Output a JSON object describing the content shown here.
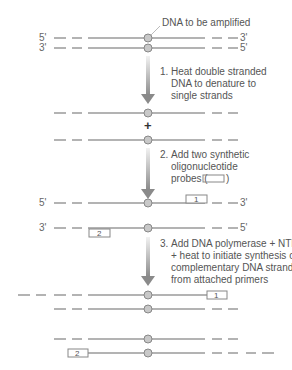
{
  "title_label": "DNA to be amplified",
  "ends": {
    "five": "5'",
    "three": "3'"
  },
  "plus": "+",
  "steps": [
    {
      "number": "1.",
      "lines": [
        "Heat double stranded",
        "DNA to denature to",
        "single strands"
      ]
    },
    {
      "number": "2.",
      "lines": [
        "Add two synthetic",
        "oligonucleotide",
        "probes ("
      ]
    },
    {
      "number": "3.",
      "lines": [
        "Add DNA polymerase + NTP",
        "+ heat to initiate synthesis of",
        "complementary DNA strands",
        "from attached primers"
      ]
    }
  ],
  "probe_close": ")",
  "primers": {
    "p1": "1",
    "p2": "2"
  },
  "colors": {
    "strand": "#9a9a9a",
    "circle_fill": "#c8c8c8",
    "arrow": "#8a8a8a"
  }
}
